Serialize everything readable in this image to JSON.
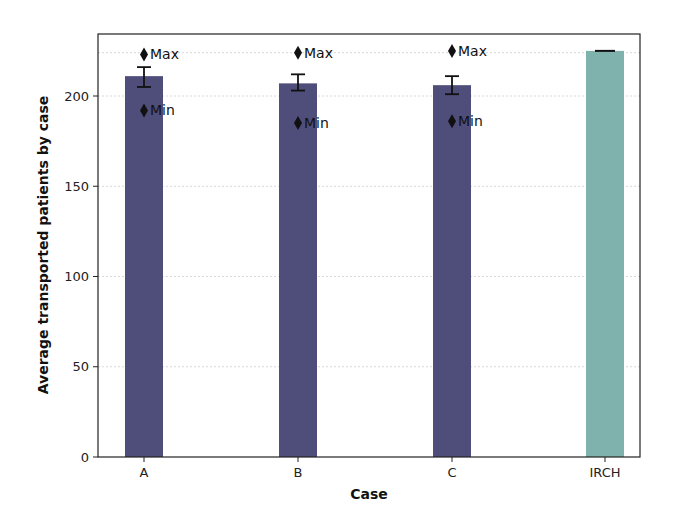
{
  "chart_data": {
    "type": "bar",
    "title": "",
    "xlabel": "Case",
    "ylabel": "Average transported patients by case",
    "categories": [
      "A",
      "B",
      "C",
      "IRCH"
    ],
    "values": [
      211,
      207,
      206,
      225
    ],
    "error": [
      {
        "low": 205,
        "high": 216
      },
      {
        "low": 203,
        "high": 212
      },
      {
        "low": 201,
        "high": 211
      },
      {
        "low": 225,
        "high": 225
      }
    ],
    "max_markers": [
      223,
      224,
      225,
      null
    ],
    "min_markers": [
      192,
      185,
      186,
      null
    ],
    "annotations": {
      "max_label": "Max",
      "min_label": "Min"
    },
    "bar_colors": [
      "#4f4d7a",
      "#4f4d7a",
      "#4f4d7a",
      "#7fb2ad"
    ],
    "ylim": [
      0,
      237
    ],
    "yticks": [
      0,
      50,
      100,
      150,
      200
    ],
    "grid": "horizontal dotted",
    "legend": null
  }
}
